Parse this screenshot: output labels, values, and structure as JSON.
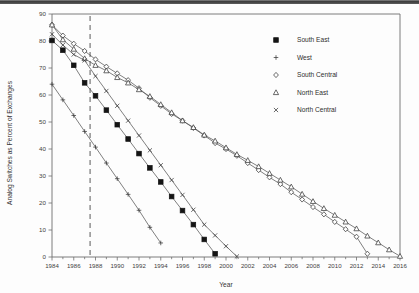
{
  "chart_data": {
    "type": "line",
    "title": "",
    "xlabel": "Year",
    "ylabel": "Analog Switches as Percent of Exchanges",
    "xlim": [
      1984,
      2016
    ],
    "ylim": [
      0,
      90
    ],
    "grid": false,
    "legend_position": "upper-right",
    "xticks": [
      1984,
      1986,
      1988,
      1990,
      1992,
      1994,
      1996,
      1998,
      2000,
      2002,
      2004,
      2006,
      2008,
      2010,
      2012,
      2014,
      2016
    ],
    "xtick_labels": [
      "1984",
      "1986",
      "1988",
      "1990",
      "1992",
      "1994",
      "1996",
      "1998",
      "2000",
      "2002",
      "2004",
      "2006",
      "2008",
      "2010",
      "2012",
      "2014",
      "2016"
    ],
    "yticks": [
      0,
      10,
      20,
      30,
      40,
      50,
      60,
      70,
      80,
      90
    ],
    "ytick_labels": [
      "0",
      "10",
      "20",
      "30",
      "40",
      "50",
      "60",
      "70",
      "80",
      "90"
    ],
    "xtick_minor_step": 1,
    "annotations": [
      {
        "name": "divestiture-reference-line",
        "type": "vline",
        "x": 1987.5,
        "style": "dashed",
        "label": ""
      }
    ],
    "series": [
      {
        "name": "South East",
        "marker": "filled-square",
        "x": [
          1984,
          1985,
          1986,
          1987,
          1988,
          1989,
          1990,
          1991,
          1992,
          1993,
          1994,
          1995,
          1996,
          1997,
          1998,
          1999
        ],
        "values": [
          80.2,
          76.6,
          71.0,
          64.5,
          59.7,
          54.4,
          49.0,
          43.7,
          38.3,
          33.0,
          27.8,
          22.4,
          17.2,
          12.0,
          6.5,
          1.2
        ]
      },
      {
        "name": "West",
        "marker": "plus",
        "x": [
          1984,
          1985,
          1986,
          1987,
          1988,
          1989,
          1990,
          1991,
          1992,
          1993,
          1994
        ],
        "values": [
          64.0,
          58.2,
          52.4,
          46.5,
          40.7,
          34.8,
          29.0,
          23.2,
          17.3,
          11.0,
          5.2
        ]
      },
      {
        "name": "South Central",
        "marker": "diamond",
        "x": [
          1984,
          1985,
          1986,
          1987,
          1988,
          1989,
          1990,
          1991,
          1992,
          1993,
          1994,
          1995,
          1996,
          1997,
          1998,
          1999,
          2000,
          2001,
          2002,
          2003,
          2004,
          2005,
          2006,
          2007,
          2008,
          2009,
          2010,
          2011,
          2012,
          2013
        ],
        "values": [
          86.0,
          82.0,
          79.0,
          76.3,
          73.2,
          70.5,
          68.0,
          65.5,
          62.5,
          59.0,
          56.0,
          53.0,
          50.5,
          47.8,
          45.0,
          42.2,
          40.0,
          37.5,
          34.8,
          32.2,
          29.5,
          27.0,
          24.0,
          21.3,
          18.5,
          15.8,
          13.0,
          10.3,
          7.5,
          1.2
        ]
      },
      {
        "name": "North East",
        "marker": "triangle",
        "x": [
          1984,
          1985,
          1986,
          1987,
          1988,
          1989,
          1990,
          1991,
          1992,
          1993,
          1994,
          1995,
          1996,
          1997,
          1998,
          1999,
          2000,
          2001,
          2002,
          2003,
          2004,
          2005,
          2006,
          2007,
          2008,
          2009,
          2010,
          2011,
          2012,
          2013,
          2014,
          2015,
          2016
        ],
        "values": [
          86.0,
          80.5,
          77.0,
          73.5,
          71.0,
          69.0,
          66.5,
          64.5,
          62.0,
          59.5,
          56.5,
          53.5,
          50.5,
          48.0,
          45.2,
          43.0,
          40.5,
          38.0,
          35.8,
          33.5,
          31.0,
          28.5,
          26.0,
          23.3,
          20.6,
          18.0,
          15.5,
          13.0,
          10.5,
          7.8,
          5.3,
          2.7,
          0.3
        ]
      },
      {
        "name": "North Central",
        "marker": "x",
        "x": [
          1984,
          1985,
          1986,
          1987,
          1988,
          1989,
          1990,
          1991,
          1992,
          1993,
          1994,
          1995,
          1996,
          1997,
          1998,
          1999,
          2000,
          2001
        ],
        "values": [
          82.5,
          78.5,
          75.0,
          72.8,
          67.0,
          61.5,
          56.0,
          50.5,
          45.0,
          39.5,
          34.0,
          28.5,
          23.0,
          17.5,
          12.0,
          8.0,
          4.0,
          0.2
        ]
      }
    ]
  },
  "legend": {
    "entries": [
      {
        "label": "South East",
        "marker": "filled-square"
      },
      {
        "label": "West",
        "marker": "plus"
      },
      {
        "label": "South Central",
        "marker": "diamond"
      },
      {
        "label": "North East",
        "marker": "triangle"
      },
      {
        "label": "North Central",
        "marker": "x"
      }
    ]
  },
  "axes": {
    "x_title": "Year",
    "y_title": "Analog Switches as Percent of Exchanges"
  }
}
